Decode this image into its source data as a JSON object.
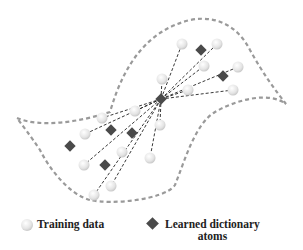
{
  "legend": {
    "training_label": "Training data",
    "atoms_label_line1": "Learned dictionary",
    "atoms_label_line2": "atoms"
  },
  "colors": {
    "outline": "#9a9a9a",
    "circle_fill": "#e6e6e6",
    "circle_stroke": "#c8c8c8",
    "diamond": "#4a4a4a",
    "line": "#222222"
  },
  "diagram": {
    "center": [
      161,
      99
    ],
    "training_points": [
      [
        182,
        44
      ],
      [
        217,
        44
      ],
      [
        204,
        66
      ],
      [
        238,
        67
      ],
      [
        162,
        79
      ],
      [
        188,
        90
      ],
      [
        233,
        90
      ],
      [
        102,
        118
      ],
      [
        135,
        111
      ],
      [
        160,
        125
      ],
      [
        85,
        134
      ],
      [
        122,
        152
      ],
      [
        84,
        165
      ],
      [
        150,
        158
      ],
      [
        111,
        186
      ],
      [
        94,
        195
      ]
    ],
    "atoms": [
      [
        201,
        50
      ],
      [
        223,
        76
      ],
      [
        111,
        130
      ],
      [
        132,
        133
      ],
      [
        70,
        146
      ],
      [
        105,
        165
      ]
    ],
    "connected_points": [
      [
        182,
        44
      ],
      [
        217,
        44
      ],
      [
        204,
        66
      ],
      [
        238,
        67
      ],
      [
        162,
        79
      ],
      [
        188,
        90
      ],
      [
        233,
        90
      ],
      [
        102,
        118
      ],
      [
        135,
        111
      ],
      [
        160,
        125
      ],
      [
        85,
        134
      ],
      [
        84,
        165
      ],
      [
        150,
        158
      ],
      [
        111,
        186
      ],
      [
        94,
        195
      ]
    ]
  }
}
